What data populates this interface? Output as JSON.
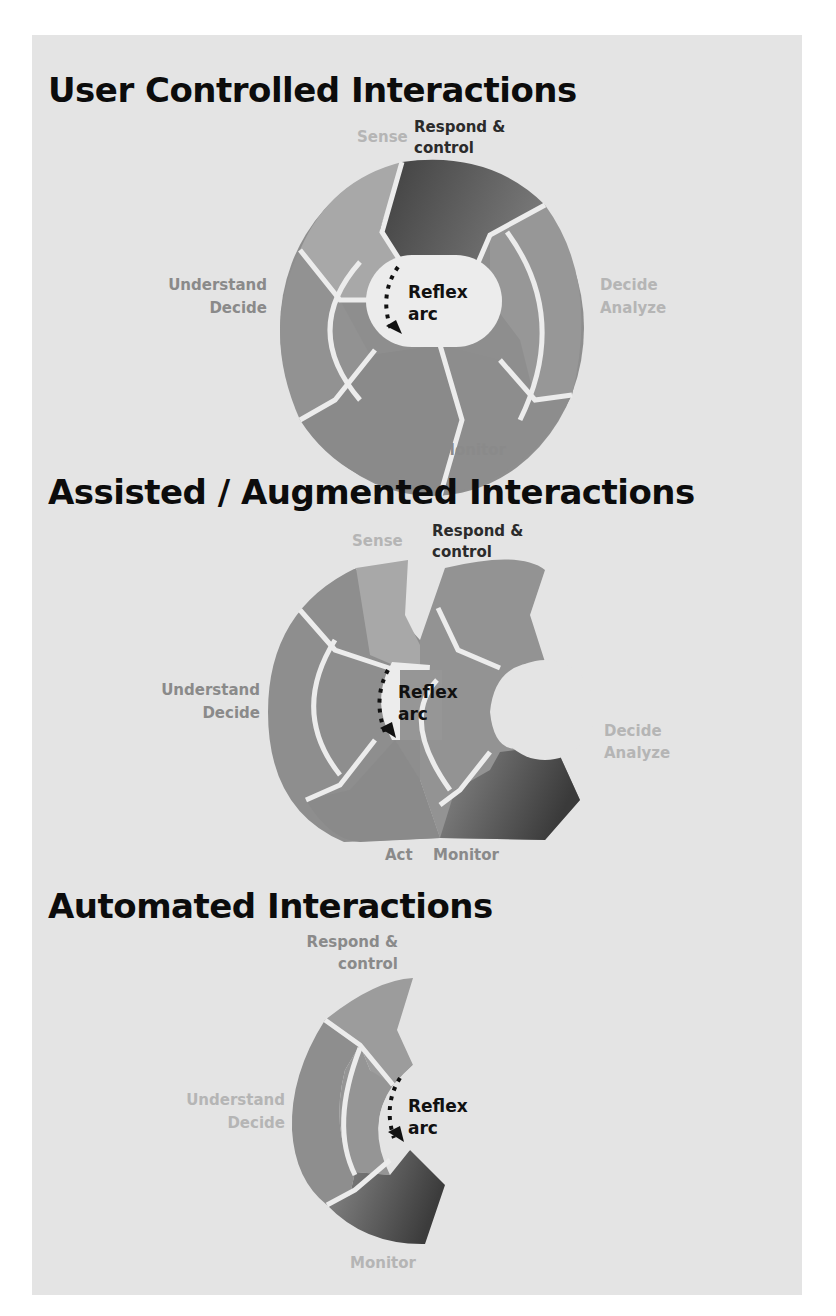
{
  "sections": [
    {
      "title": "User Controlled Interactions",
      "labels": {
        "sense": "Sense",
        "respond_line1": "Respond &",
        "respond_line2": "control",
        "understand_line1": "Understand",
        "understand_line2": "Decide",
        "decide_line1": "Decide",
        "decide_line2": "Analyze",
        "act": "Act",
        "monitor": "Monitor",
        "reflex_line1": "Reflex",
        "reflex_line2": "arc"
      }
    },
    {
      "title": "Assisted / Augmented Interactions",
      "labels": {
        "sense": "Sense",
        "respond_line1": "Respond &",
        "respond_line2": "control",
        "understand_line1": "Understand",
        "understand_line2": "Decide",
        "decide_line1": "Decide",
        "decide_line2": "Analyze",
        "act": "Act",
        "monitor": "Monitor",
        "reflex_line1": "Reflex",
        "reflex_line2": "arc"
      }
    },
    {
      "title": "Automated Interactions",
      "labels": {
        "respond_line1": "Respond &",
        "respond_line2": "control",
        "understand_line1": "Understand",
        "understand_line2": "Decide",
        "monitor": "Monitor",
        "reflex_line1": "Reflex",
        "reflex_line2": "arc"
      }
    }
  ],
  "colors": {
    "background": "#ffffff",
    "card": "#e4e4e4",
    "segment_light": "#a9a9a9",
    "segment_mid": "#8f8f8f",
    "segment_dark": "#4a4a4a",
    "divider": "#ececec",
    "title": "#0c0c0c"
  }
}
